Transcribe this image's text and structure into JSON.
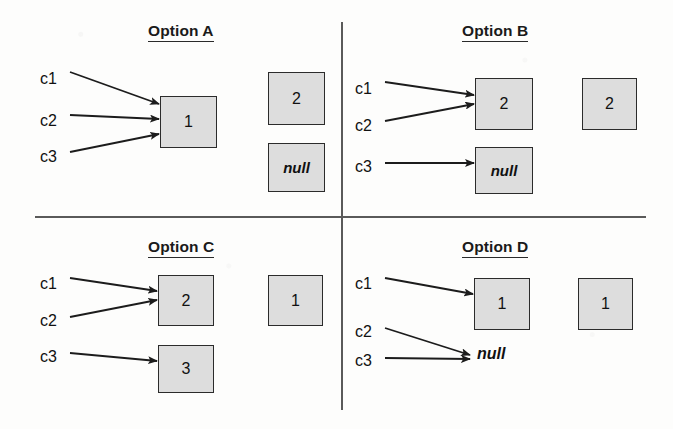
{
  "figure": {
    "background_color": "#fdfdfc",
    "box_fill_color": "#dddddd",
    "box_border_color": "#2b2b2b",
    "line_color": "#5a5a5a",
    "null_text": "null"
  },
  "dividers": {
    "vertical": {
      "x": 341,
      "y1": 22,
      "y2": 410
    },
    "horizontal": {
      "y": 216,
      "x1": 35,
      "x2": 646
    }
  },
  "quadrants": [
    {
      "id": "option-a",
      "title": "Option A",
      "title_x": 148,
      "title_y": 22,
      "refs": [
        {
          "name": "c1",
          "label": "c1",
          "x": 40,
          "y": 70,
          "target": "box-1"
        },
        {
          "name": "c2",
          "label": "c2",
          "x": 40,
          "y": 112,
          "target": "box-1"
        },
        {
          "name": "c3",
          "label": "c3",
          "x": 40,
          "y": 148,
          "target": "box-1"
        }
      ],
      "boxes": [
        {
          "id": "box-1",
          "value": "1",
          "x": 160,
          "y": 96,
          "w": 57,
          "h": 52,
          "italic": false,
          "targeted": true
        },
        {
          "id": "box-2",
          "value": "2",
          "x": 268,
          "y": 72,
          "w": 57,
          "h": 53,
          "italic": false,
          "targeted": false
        },
        {
          "id": "box-null",
          "value": "null",
          "x": 268,
          "y": 143,
          "w": 57,
          "h": 49,
          "italic": true,
          "targeted": false
        }
      ],
      "bare_nulls": [],
      "arrows": [
        {
          "from": "c1",
          "x1": 70,
          "y1": 72,
          "x2": 159,
          "y2": 104
        },
        {
          "from": "c2",
          "x1": 70,
          "y1": 115,
          "x2": 159,
          "y2": 119
        },
        {
          "from": "c3",
          "x1": 70,
          "y1": 152,
          "x2": 159,
          "y2": 134
        }
      ]
    },
    {
      "id": "option-b",
      "title": "Option B",
      "title_x": 462,
      "title_y": 22,
      "refs": [
        {
          "name": "c1",
          "label": "c1",
          "x": 355,
          "y": 80,
          "target": "box-2"
        },
        {
          "name": "c2",
          "label": "c2",
          "x": 355,
          "y": 117,
          "target": "box-2"
        },
        {
          "name": "c3",
          "label": "c3",
          "x": 355,
          "y": 158,
          "target": "box-null"
        }
      ],
      "boxes": [
        {
          "id": "box-2",
          "value": "2",
          "x": 475,
          "y": 78,
          "w": 58,
          "h": 52,
          "italic": false,
          "targeted": true
        },
        {
          "id": "box-2b",
          "value": "2",
          "x": 582,
          "y": 78,
          "w": 55,
          "h": 52,
          "italic": false,
          "targeted": false
        },
        {
          "id": "box-null",
          "value": "null",
          "x": 475,
          "y": 147,
          "w": 58,
          "h": 47,
          "italic": true,
          "targeted": true
        }
      ],
      "bare_nulls": [],
      "arrows": [
        {
          "from": "c1",
          "x1": 385,
          "y1": 82,
          "x2": 474,
          "y2": 95
        },
        {
          "from": "c2",
          "x1": 385,
          "y1": 121,
          "x2": 474,
          "y2": 104
        },
        {
          "from": "c3",
          "x1": 385,
          "y1": 163,
          "x2": 474,
          "y2": 163
        }
      ]
    },
    {
      "id": "option-c",
      "title": "Option C",
      "title_x": 148,
      "title_y": 238,
      "refs": [
        {
          "name": "c1",
          "label": "c1",
          "x": 40,
          "y": 275,
          "target": "box-2"
        },
        {
          "name": "c2",
          "label": "c2",
          "x": 40,
          "y": 312,
          "target": "box-2"
        },
        {
          "name": "c3",
          "label": "c3",
          "x": 40,
          "y": 348,
          "target": "box-3"
        }
      ],
      "boxes": [
        {
          "id": "box-2",
          "value": "2",
          "x": 158,
          "y": 275,
          "w": 56,
          "h": 51,
          "italic": false,
          "targeted": true
        },
        {
          "id": "box-1",
          "value": "1",
          "x": 268,
          "y": 275,
          "w": 55,
          "h": 51,
          "italic": false,
          "targeted": false
        },
        {
          "id": "box-3",
          "value": "3",
          "x": 158,
          "y": 345,
          "w": 56,
          "h": 48,
          "italic": false,
          "targeted": true
        }
      ],
      "bare_nulls": [],
      "arrows": [
        {
          "from": "c1",
          "x1": 70,
          "y1": 278,
          "x2": 157,
          "y2": 291
        },
        {
          "from": "c2",
          "x1": 70,
          "y1": 317,
          "x2": 157,
          "y2": 300
        },
        {
          "from": "c3",
          "x1": 70,
          "y1": 353,
          "x2": 157,
          "y2": 361
        }
      ]
    },
    {
      "id": "option-d",
      "title": "Option D",
      "title_x": 462,
      "title_y": 238,
      "refs": [
        {
          "name": "c1",
          "label": "c1",
          "x": 355,
          "y": 275,
          "target": "box-1"
        },
        {
          "name": "c2",
          "label": "c2",
          "x": 355,
          "y": 323,
          "target": "bare-null"
        },
        {
          "name": "c3",
          "label": "c3",
          "x": 355,
          "y": 352,
          "target": "bare-null"
        }
      ],
      "boxes": [
        {
          "id": "box-1",
          "value": "1",
          "x": 474,
          "y": 278,
          "w": 56,
          "h": 52,
          "italic": false,
          "targeted": true
        },
        {
          "id": "box-1b",
          "value": "1",
          "x": 578,
          "y": 278,
          "w": 55,
          "h": 52,
          "italic": false,
          "targeted": false
        }
      ],
      "bare_nulls": [
        {
          "id": "bare-null",
          "value": "null",
          "x": 477,
          "y": 345
        }
      ],
      "arrows": [
        {
          "from": "c1",
          "x1": 385,
          "y1": 278,
          "x2": 473,
          "y2": 294
        },
        {
          "from": "c2",
          "x1": 385,
          "y1": 328,
          "x2": 470,
          "y2": 355
        },
        {
          "from": "c3",
          "x1": 385,
          "y1": 358,
          "x2": 470,
          "y2": 359
        }
      ]
    }
  ]
}
